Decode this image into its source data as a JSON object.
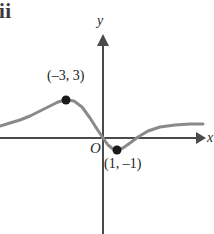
{
  "figure": {
    "part_label": "ii",
    "background_color": "#ffffff"
  },
  "axes": {
    "x_label": "x",
    "y_label": "y",
    "origin_label": "O",
    "axis_color": "#4a4a4a",
    "x_axis_y_px": 138,
    "y_axis_x_px": 103,
    "x_axis_start_px": 0,
    "x_axis_end_px": 203,
    "y_axis_top_px": 38,
    "y_axis_bottom_px": 234
  },
  "chart_data": {
    "type": "line",
    "title": "",
    "xlabel": "x",
    "ylabel": "y",
    "grid": false,
    "legend": false,
    "curve_color": "#8a8a8a",
    "marker_color": "#1a1a1a",
    "annotated_points": [
      {
        "label": "(–3, 3)",
        "x": -3,
        "y": 3,
        "type": "local-maximum",
        "px": 66,
        "py": 100
      },
      {
        "label": "(1, –1)",
        "x": 1,
        "y": -1,
        "type": "local-minimum",
        "px": 117,
        "py": 150
      }
    ],
    "x_intercepts": [
      0,
      2.6
    ],
    "curve_points_px": [
      [
        0,
        126
      ],
      [
        10,
        123
      ],
      [
        20,
        120
      ],
      [
        30,
        116
      ],
      [
        40,
        111
      ],
      [
        50,
        106
      ],
      [
        58,
        102
      ],
      [
        66,
        100
      ],
      [
        74,
        101
      ],
      [
        82,
        107
      ],
      [
        90,
        118
      ],
      [
        97,
        129
      ],
      [
        103,
        138
      ],
      [
        108,
        145
      ],
      [
        113,
        149
      ],
      [
        117,
        150
      ],
      [
        123,
        148
      ],
      [
        130,
        143
      ],
      [
        138,
        137
      ],
      [
        148,
        131
      ],
      [
        160,
        127
      ],
      [
        175,
        125
      ],
      [
        190,
        124
      ],
      [
        203,
        124
      ]
    ]
  }
}
